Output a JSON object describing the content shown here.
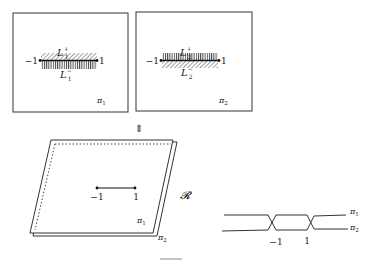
{
  "diagram": {
    "panel1": {
      "sheet_label": "π",
      "sheet_sub": "1",
      "left_endpoint": "−1",
      "right_endpoint": "1",
      "upper_label": "L",
      "upper_sub": "1",
      "upper_sup": "+",
      "lower_label": "L",
      "lower_sub": "1",
      "lower_sup": "−"
    },
    "panel2": {
      "sheet_label": "π",
      "sheet_sub": "2",
      "left_endpoint": "−1",
      "right_endpoint": "1",
      "upper_label": "L",
      "upper_sub": "2",
      "upper_sup": "+",
      "lower_label": "L",
      "lower_sub": "2",
      "lower_sup": "−"
    },
    "equivalence_arrow": "⇕",
    "surface": {
      "label": "𝓡",
      "left_endpoint": "−1",
      "right_endpoint": "1",
      "sheet1": "π",
      "sheet1_sub": "1",
      "sheet2": "π",
      "sheet2_sub": "2"
    },
    "crossing": {
      "left_point": "−1",
      "right_point": "1",
      "top_label": "π",
      "top_sub": "1",
      "bottom_label": "π",
      "bottom_sub": "2"
    }
  }
}
